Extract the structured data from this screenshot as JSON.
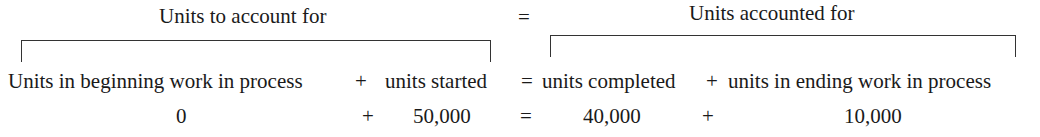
{
  "header": {
    "left_label": "Units to account for",
    "equals": "=",
    "right_label": "Units accounted for"
  },
  "equation_terms": {
    "beginning_wip": "Units in beginning work in process",
    "plus1": "+",
    "units_started": "units started",
    "equals": "=",
    "units_completed": "units completed",
    "plus2": "+",
    "ending_wip": "units in ending work in process"
  },
  "equation_values": {
    "beginning_wip": "0",
    "plus1": "+",
    "units_started": "50,000",
    "equals": "=",
    "units_completed": "40,000",
    "plus2": "+",
    "ending_wip": "10,000"
  }
}
